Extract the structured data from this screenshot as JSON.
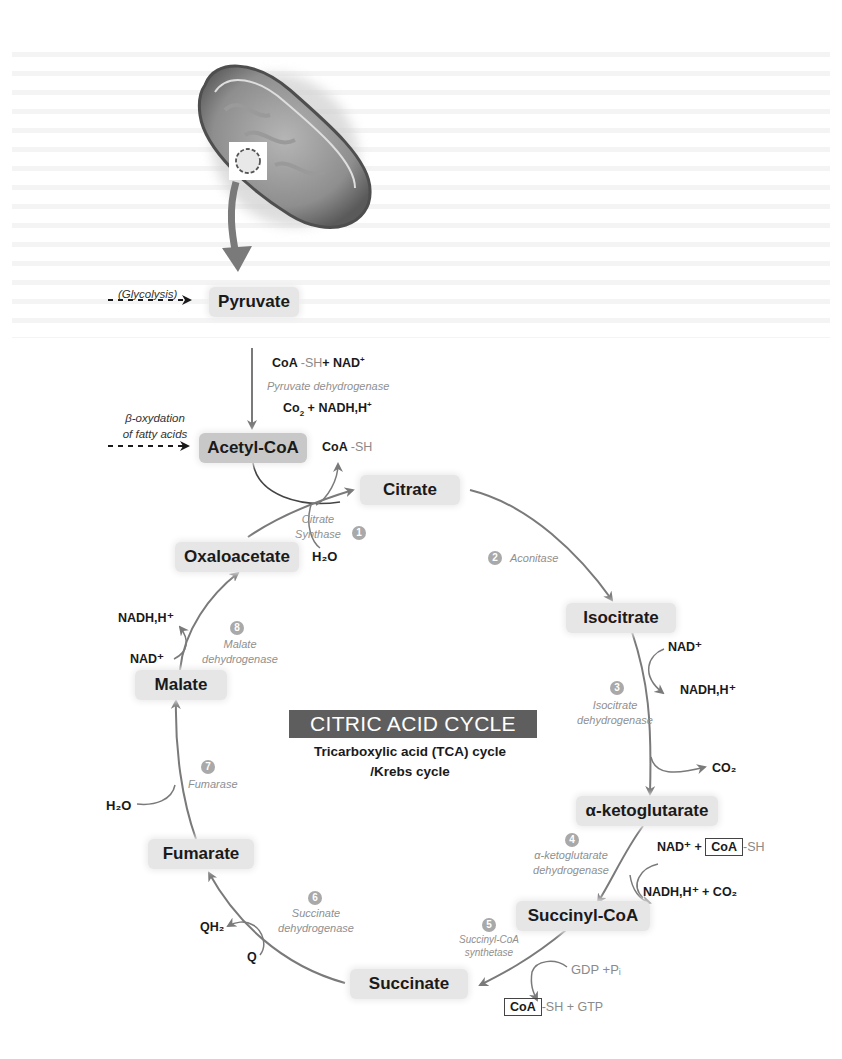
{
  "title": {
    "main": "CITRIC ACID CYCLE",
    "subtitle_line1": "Tricarboxylic acid (TCA) cycle",
    "subtitle_line2": "/Krebs cycle"
  },
  "image": {
    "icon": "mitochondrion-illustration"
  },
  "inputs": {
    "glycolysis": "(Glycolysis)",
    "beta_oxidation_line1": "β-oxydation",
    "beta_oxidation_line2": "of fatty acids"
  },
  "nodes": {
    "pyruvate": "Pyruvate",
    "acetyl_coa": "Acetyl-CoA",
    "citrate": "Citrate",
    "isocitrate": "Isocitrate",
    "alpha_ketoglutarate": "α-ketoglutarate",
    "succinyl_coa": "Succinyl-CoA",
    "succinate": "Succinate",
    "fumarate": "Fumarate",
    "malate": "Malate",
    "oxaloacetate": "Oxaloacetate"
  },
  "pdh": {
    "in_coa": "CoA",
    "in_rest": "-SH",
    "in_plus": "+ NAD",
    "enzyme": "Pyruvate dehydrogenase",
    "out_co": "Co",
    "out_rest": "+ NADH,H",
    "released_coa": "CoA",
    "released_rest": "-SH"
  },
  "steps": [
    {
      "number": "1",
      "enzyme_line1": "Citrate",
      "enzyme_line2": "Synthase",
      "inputs": "H₂O"
    },
    {
      "number": "2",
      "enzyme_line1": "Aconitase"
    },
    {
      "number": "3",
      "enzyme_line1": "Isocitrate",
      "enzyme_line2": "dehydrogenase",
      "in": "NAD⁺",
      "out": "NADH,H⁺",
      "co2": "CO₂"
    },
    {
      "number": "4",
      "enzyme_line1": "α-ketoglutarate",
      "enzyme_line2": "dehydrogenase",
      "in_nad": "NAD⁺ +",
      "in_coa": "CoA",
      "in_rest": "-SH",
      "out": "NADH,H⁺ + CO₂"
    },
    {
      "number": "5",
      "enzyme_line1": "Succinyl-CoA",
      "enzyme_line2": "synthetase",
      "in": "GDP +Pᵢ",
      "out_coa": "CoA",
      "out_rest": "-SH",
      "out_gtp": "+ GTP"
    },
    {
      "number": "6",
      "enzyme_line1": "Succinate",
      "enzyme_line2": "dehydrogenase",
      "in": "Q",
      "out": "QH₂"
    },
    {
      "number": "7",
      "enzyme_line1": "Fumarase",
      "in": "H₂O"
    },
    {
      "number": "8",
      "enzyme_line1": "Malate",
      "enzyme_line2": "dehydrogenase",
      "in": "NAD⁺",
      "out": "NADH,H⁺"
    }
  ],
  "colors": {
    "arrow": "#7a7a7a",
    "node_bg": "#e6e6e6",
    "node_dark_bg": "#c8c8c8",
    "title_bg": "#5e5e5e",
    "step_badge": "#a9a9a9"
  }
}
